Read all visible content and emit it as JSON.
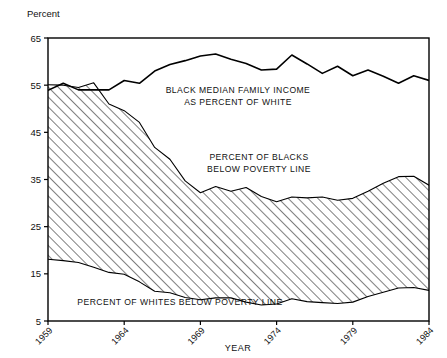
{
  "chart_data": {
    "type": "area",
    "title": "",
    "xlabel": "YEAR",
    "ylabel": "Percent",
    "ylim": [
      5,
      65
    ],
    "xlim": [
      1959,
      1984
    ],
    "yticks": [
      5,
      15,
      25,
      35,
      45,
      55,
      65
    ],
    "xticks": [
      1959,
      1964,
      1969,
      1974,
      1979,
      1984
    ],
    "grid": false,
    "legend_position": "inline-annotations",
    "x": [
      1959,
      1960,
      1961,
      1962,
      1963,
      1964,
      1965,
      1966,
      1967,
      1968,
      1969,
      1970,
      1971,
      1972,
      1973,
      1974,
      1975,
      1976,
      1977,
      1978,
      1979,
      1980,
      1981,
      1982,
      1983,
      1984
    ],
    "series": [
      {
        "name": "BLACK MEDIAN FAMILY INCOME AS PERCENT OF WHITE",
        "annotation": "BLACK MEDIAN FAMILY INCOME\nAS PERCENT OF WHITE",
        "style": "line",
        "values": [
          53.9,
          55.4,
          54.0,
          54.0,
          54.0,
          56.0,
          55.4,
          58.0,
          59.4,
          60.2,
          61.2,
          61.6,
          60.5,
          59.6,
          58.2,
          58.4,
          61.4,
          59.5,
          57.5,
          59.0,
          57.0,
          58.2,
          56.9,
          55.4,
          57.0,
          56.0
        ]
      },
      {
        "name": "PERCENT OF BLACKS BELOW POVERTY LINE",
        "annotation": "PERCENT OF BLACKS\nBELOW POVERTY LINE",
        "style": "area-top",
        "values": [
          55.1,
          55.0,
          54.5,
          55.5,
          51.0,
          49.6,
          47.1,
          41.8,
          39.3,
          34.7,
          32.2,
          33.5,
          32.5,
          33.3,
          31.4,
          30.3,
          31.3,
          31.1,
          31.3,
          30.6,
          31.0,
          32.5,
          34.2,
          35.6,
          35.7,
          33.8
        ]
      },
      {
        "name": "PERCENT OF WHITES BELOW POVERTY LINE",
        "annotation": "PERCENT OF WHITES BELOW POVERTY LINE",
        "style": "area-bottom",
        "values": [
          18.1,
          17.8,
          17.4,
          16.4,
          15.3,
          14.9,
          13.3,
          11.3,
          11.0,
          10.0,
          9.5,
          9.9,
          9.9,
          9.0,
          8.4,
          8.6,
          9.7,
          9.1,
          8.9,
          8.7,
          9.0,
          10.2,
          11.1,
          12.0,
          12.1,
          11.5
        ]
      }
    ],
    "hatch_region": {
      "between": [
        "PERCENT OF BLACKS BELOW POVERTY LINE",
        "PERCENT OF WHITES BELOW POVERTY LINE"
      ],
      "pattern": "diagonal-lines",
      "color": "#000000"
    }
  },
  "annotations": {
    "income_line1": "BLACK MEDIAN FAMILY INCOME",
    "income_line2": "AS PERCENT OF WHITE",
    "blacks_line1": "PERCENT OF BLACKS",
    "blacks_line2": "BELOW POVERTY LINE",
    "whites_line1": "PERCENT OF WHITES BELOW POVERTY LINE"
  },
  "axes": {
    "y_axis_title": "Percent",
    "x_axis_title": "YEAR",
    "y_tick_labels": [
      "65",
      "55",
      "45",
      "35",
      "25",
      "15",
      "5"
    ],
    "x_tick_labels": [
      "1959",
      "1964",
      "1969",
      "1974",
      "1979",
      "1984"
    ]
  }
}
